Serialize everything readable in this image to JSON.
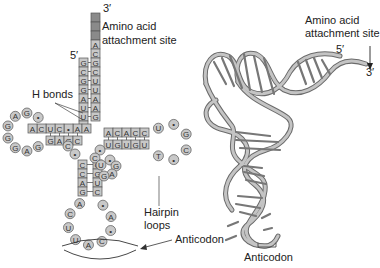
{
  "left_panel": {
    "title": "tRNA cloverleaf secondary structure",
    "labels": {
      "three_prime": "3′",
      "five_prime": "5′",
      "amino_acid_site_line1": "Amino acid",
      "amino_acid_site_line2": "attachment site",
      "h_bonds": "H bonds",
      "hairpin_line1": "Hairpin",
      "hairpin_line2": "loops",
      "anticodon": "Anticodon"
    },
    "acceptor_stem": {
      "five_prime_strand": [
        "G",
        "C",
        "G",
        "G",
        "A",
        "U",
        "U",
        "U"
      ],
      "three_prime_strand": [
        "A",
        "C",
        "G",
        "C",
        "U",
        "U",
        "A",
        "A"
      ],
      "terminal_blank_boxes": 3
    },
    "d_arm": {
      "top_strand": [
        "A",
        "C",
        "U",
        "C",
        "•",
        "A"
      ],
      "bottom_strand": [
        "G",
        "A",
        "G",
        "C"
      ],
      "loop": [
        "•",
        "G",
        "A",
        "G",
        "G",
        "G",
        "A",
        "G"
      ]
    },
    "t_arm": {
      "top_strand": [
        "A",
        "C",
        "A",
        "C",
        "C"
      ],
      "bottom_strand": [
        "U",
        "G",
        "U",
        "G",
        "U"
      ],
      "loop": [
        "U",
        "•",
        "G",
        "C",
        "•",
        "T"
      ]
    },
    "anticodon_arm": {
      "left_strand": [
        "C",
        "C",
        "A",
        "G"
      ],
      "right_strand": [
        "G",
        "G",
        "U",
        "C"
      ],
      "loop": [
        "A",
        "C",
        "U",
        "U",
        "A",
        "C",
        "•",
        "A",
        "•"
      ]
    },
    "variable_loop": [
      "•",
      "C",
      "U",
      "•",
      "G",
      "A",
      "G"
    ]
  },
  "right_panel": {
    "title": "tRNA 3D L-shaped structure",
    "labels": {
      "amino_acid_site_line1": "Amino acid",
      "amino_acid_site_line2": "attachment site",
      "five_prime": "5′",
      "three_prime": "3′",
      "anticodon": "Anticodon"
    }
  },
  "colors": {
    "box_fill": "#c8c8c8",
    "box_stroke": "#555555",
    "blank_box_fill": "#8a8a8a",
    "ribbon_fill": "#bdbdbd",
    "ribbon_stroke": "#6a6a6a",
    "text": "#222222"
  }
}
